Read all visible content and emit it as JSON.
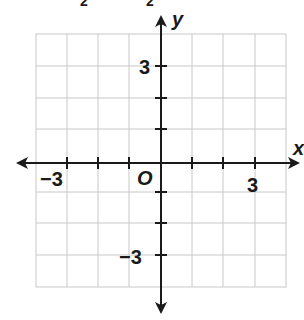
{
  "figure": {
    "type": "coordinate-plane",
    "top_fragment": [
      "2",
      "2"
    ],
    "axes": {
      "x_label": "x",
      "y_label": "y",
      "origin_label": "O",
      "x_ticks_labeled": {
        "neg": "−3",
        "pos": "3"
      },
      "y_ticks_labeled": {
        "pos": "3",
        "neg": "−3"
      },
      "range": [
        -4,
        4
      ]
    },
    "grid": {
      "cols": 8,
      "rows": 8,
      "line_color": "#c8c8c8",
      "axis_color": "#1a1a1a"
    }
  }
}
